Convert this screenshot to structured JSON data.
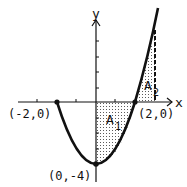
{
  "diagram": {
    "function": "y = x^2 - 4",
    "axes": {
      "x_label": "x",
      "y_label": "y"
    },
    "points": [
      {
        "label": "(-2,0)",
        "x": -2,
        "y": 0
      },
      {
        "label": "(2,0)",
        "x": 2,
        "y": 0
      },
      {
        "label": "(0,-4)",
        "x": 0,
        "y": -4
      }
    ],
    "regions": [
      {
        "label": "A",
        "subscript": "1",
        "from_x": 0,
        "to_x": 2
      },
      {
        "label": "A",
        "subscript": "2",
        "from_x": 2,
        "to_x": 3
      }
    ],
    "colors": {
      "ink": "#111111",
      "background": "#ffffff"
    }
  }
}
